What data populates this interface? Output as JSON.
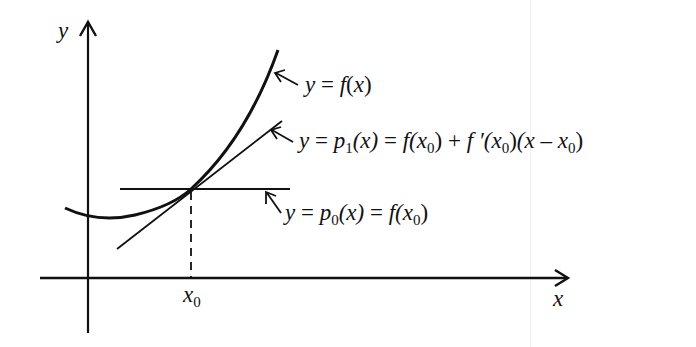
{
  "diagram": {
    "title": "",
    "axes": {
      "x_label": "x",
      "y_label": "y",
      "x_tick_label": "x",
      "x_tick_sub": "0"
    },
    "labels": {
      "f": {
        "y": "y",
        "eq": " = ",
        "f": "f",
        "open": "(",
        "x": "x",
        "close": ")"
      },
      "p1": {
        "y": "y",
        "eq1": " = ",
        "p": "p",
        "psub": "1",
        "px": "(x)",
        "eq2": " = ",
        "f": "f",
        "fx": "(x",
        "fsub": "0",
        "fclose": ")",
        "plus": " + ",
        "fp": "f ′",
        "fpx": "(x",
        "fpsub": "0",
        "fpclose": ")",
        "lin": "(x – x",
        "linsub": "0",
        "linclose": ")"
      },
      "p0": {
        "y": "y",
        "eq1": " = ",
        "p": "p",
        "psub": "0",
        "px": "(x)",
        "eq2": " = ",
        "f": "f",
        "fx": "(x",
        "fsub": "0",
        "fclose": ")"
      }
    },
    "elements": [
      "curve y = f(x)",
      "tangent line y = p1(x)",
      "horizontal line y = p0(x)",
      "dashed vertical at x0"
    ],
    "colors": {
      "ink": "#111111",
      "background": "#ffffff"
    }
  }
}
